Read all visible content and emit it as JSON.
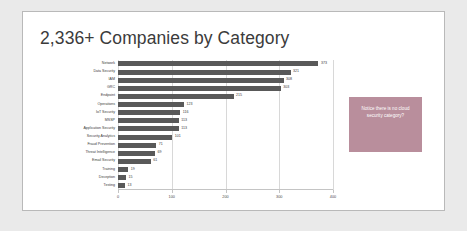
{
  "slide": {
    "title": "2,336+ Companies by Category"
  },
  "callout": {
    "text": "Notice there is no cloud security category?",
    "color": "#b98e9c"
  },
  "chart_data": {
    "type": "bar",
    "orientation": "horizontal",
    "title": "2,336+ Companies by Category",
    "xlabel": "",
    "ylabel": "",
    "xlim": [
      0,
      400
    ],
    "ticks": [
      0,
      100,
      200,
      300,
      400
    ],
    "grid": true,
    "legend": "none",
    "bar_color": "#595959",
    "categories": [
      "Network",
      "Data Security",
      "IAM",
      "GRC",
      "Endpoint",
      "Operations",
      "IoT Security",
      "MSSP",
      "Application Security",
      "Security Analytics",
      "Fraud Prevention",
      "Threat Intelligence",
      "Email Security",
      "Training",
      "Deception",
      "Testing"
    ],
    "values": [
      373,
      321,
      308,
      303,
      215,
      123,
      116,
      113,
      113,
      101,
      71,
      69,
      61,
      19,
      15,
      13
    ]
  }
}
